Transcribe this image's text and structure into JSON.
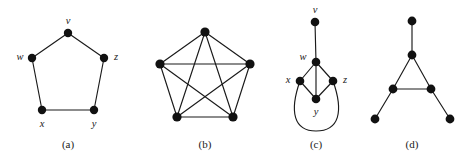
{
  "figure": {
    "background_color": "#ffffff",
    "edge_color": "#1a1a1a",
    "vertex_color": "#111111",
    "label_color": "#1a1a1a",
    "width": 468,
    "height": 165,
    "panels": [
      {
        "id": "a",
        "caption": "(a)",
        "caption_x": 68,
        "caption_y": 148,
        "description": "cycle graph on five vertices",
        "vertices": [
          {
            "id": "v",
            "label": "v",
            "x": 68,
            "y": 33,
            "r": 4.2,
            "label_x": 68,
            "label_y": 22,
            "label_anchor": "middle"
          },
          {
            "id": "w",
            "label": "w",
            "x": 32,
            "y": 58,
            "r": 4.2,
            "label_x": 20,
            "label_y": 58,
            "label_anchor": "middle"
          },
          {
            "id": "z",
            "label": "z",
            "x": 104,
            "y": 58,
            "r": 4.2,
            "label_x": 116,
            "label_y": 58,
            "label_anchor": "middle"
          },
          {
            "id": "x",
            "label": "x",
            "x": 42,
            "y": 110,
            "r": 4.2,
            "label_x": 42,
            "label_y": 125,
            "label_anchor": "middle"
          },
          {
            "id": "y",
            "label": "y",
            "x": 94,
            "y": 110,
            "r": 4.2,
            "label_x": 94,
            "label_y": 125,
            "label_anchor": "middle"
          }
        ],
        "edges": [
          {
            "from": "v",
            "to": "w"
          },
          {
            "from": "v",
            "to": "z"
          },
          {
            "from": "w",
            "to": "x"
          },
          {
            "from": "z",
            "to": "y"
          },
          {
            "from": "x",
            "to": "y"
          }
        ],
        "curved_edges": []
      },
      {
        "id": "b",
        "caption": "(b)",
        "caption_x": 205,
        "caption_y": 148,
        "description": "complete graph on five vertices",
        "vertices": [
          {
            "id": "n1",
            "label": "",
            "x": 205,
            "y": 32,
            "r": 4.6,
            "label_x": 205,
            "label_y": 32,
            "label_anchor": "middle"
          },
          {
            "id": "n2",
            "label": "",
            "x": 160,
            "y": 64,
            "r": 4.6,
            "label_x": 160,
            "label_y": 64,
            "label_anchor": "middle"
          },
          {
            "id": "n3",
            "label": "",
            "x": 250,
            "y": 64,
            "r": 4.6,
            "label_x": 250,
            "label_y": 64,
            "label_anchor": "middle"
          },
          {
            "id": "n4",
            "label": "",
            "x": 177,
            "y": 117,
            "r": 4.6,
            "label_x": 177,
            "label_y": 117,
            "label_anchor": "middle"
          },
          {
            "id": "n5",
            "label": "",
            "x": 233,
            "y": 117,
            "r": 4.6,
            "label_x": 233,
            "label_y": 117,
            "label_anchor": "middle"
          }
        ],
        "edges": [
          {
            "from": "n1",
            "to": "n2"
          },
          {
            "from": "n1",
            "to": "n3"
          },
          {
            "from": "n1",
            "to": "n4"
          },
          {
            "from": "n1",
            "to": "n5"
          },
          {
            "from": "n2",
            "to": "n3"
          },
          {
            "from": "n2",
            "to": "n4"
          },
          {
            "from": "n2",
            "to": "n5"
          },
          {
            "from": "n3",
            "to": "n4"
          },
          {
            "from": "n3",
            "to": "n5"
          },
          {
            "from": "n4",
            "to": "n5"
          }
        ],
        "curved_edges": []
      },
      {
        "id": "c",
        "caption": "(c)",
        "caption_x": 316,
        "caption_y": 148,
        "description": "pendant vertex with diamond and a curved edge",
        "vertices": [
          {
            "id": "v",
            "label": "v",
            "x": 315,
            "y": 22,
            "r": 4.3,
            "label_x": 315,
            "label_y": 11,
            "label_anchor": "middle"
          },
          {
            "id": "w",
            "label": "w",
            "x": 316,
            "y": 62,
            "r": 4.3,
            "label_x": 303,
            "label_y": 58,
            "label_anchor": "middle"
          },
          {
            "id": "x",
            "label": "x",
            "x": 300,
            "y": 81,
            "r": 4.3,
            "label_x": 288,
            "label_y": 81,
            "label_anchor": "middle"
          },
          {
            "id": "z",
            "label": "z",
            "x": 333,
            "y": 81,
            "r": 4.3,
            "label_x": 345,
            "label_y": 81,
            "label_anchor": "middle"
          },
          {
            "id": "y",
            "label": "y",
            "x": 316,
            "y": 99,
            "r": 4.3,
            "label_x": 316,
            "label_y": 113,
            "label_anchor": "middle"
          }
        ],
        "edges": [
          {
            "from": "v",
            "to": "w"
          },
          {
            "from": "w",
            "to": "x"
          },
          {
            "from": "w",
            "to": "z"
          },
          {
            "from": "w",
            "to": "y"
          },
          {
            "from": "x",
            "to": "y"
          },
          {
            "from": "z",
            "to": "y"
          }
        ],
        "curved_edges": [
          {
            "from": "x",
            "to": "z",
            "path": "M 300 81 C 289 112, 294 131, 316 131 C 339 131, 344 112, 333 81"
          }
        ]
      },
      {
        "id": "d",
        "caption": "(d)",
        "caption_x": 412,
        "caption_y": 148,
        "description": "triangle with three pendant vertices",
        "vertices": [
          {
            "id": "t",
            "label": "",
            "x": 412,
            "y": 21,
            "r": 4.4,
            "label_x": 412,
            "label_y": 21,
            "label_anchor": "middle"
          },
          {
            "id": "ap",
            "label": "",
            "x": 412,
            "y": 55,
            "r": 4.4,
            "label_x": 412,
            "label_y": 55,
            "label_anchor": "middle"
          },
          {
            "id": "bl",
            "label": "",
            "x": 393,
            "y": 89,
            "r": 4.4,
            "label_x": 393,
            "label_y": 89,
            "label_anchor": "middle"
          },
          {
            "id": "br",
            "label": "",
            "x": 431,
            "y": 89,
            "r": 4.4,
            "label_x": 431,
            "label_y": 89,
            "label_anchor": "middle"
          },
          {
            "id": "pl",
            "label": "",
            "x": 375,
            "y": 119,
            "r": 4.4,
            "label_x": 375,
            "label_y": 119,
            "label_anchor": "middle"
          },
          {
            "id": "pr",
            "label": "",
            "x": 450,
            "y": 119,
            "r": 4.4,
            "label_x": 450,
            "label_y": 119,
            "label_anchor": "middle"
          }
        ],
        "edges": [
          {
            "from": "t",
            "to": "ap"
          },
          {
            "from": "ap",
            "to": "bl"
          },
          {
            "from": "ap",
            "to": "br"
          },
          {
            "from": "bl",
            "to": "br"
          },
          {
            "from": "bl",
            "to": "pl"
          },
          {
            "from": "br",
            "to": "pr"
          }
        ],
        "curved_edges": []
      }
    ]
  }
}
